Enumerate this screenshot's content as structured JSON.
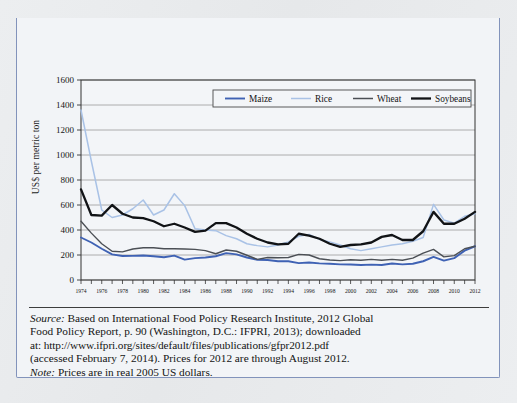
{
  "figure": {
    "number_label": "FIGURE 9.3",
    "title": "World Prices for Agricultural Commodities, 1974–2012"
  },
  "note": {
    "source_label": "Source:",
    "source_line1": " Based on International Food Policy Research Institute, 2012 Global",
    "source_line2": "Food Policy Report, p. 90 (Washington, D.C.: IFPRI, 2013); downloaded",
    "source_line3": "at: http://www.ifpri.org/sites/default/files/publications/gfpr2012.pdf",
    "source_line4": "(accessed February 7, 2014). Prices for 2012 are through August 2012.",
    "note_label": "Note:",
    "note_line": " Prices are in real 2005 US dollars."
  },
  "colors": {
    "header_blue": "#2a4c9b",
    "box_border": "#8293bb",
    "maize": "#3f62b4",
    "rice": "#a9c2e6",
    "wheat": "#4b4f55",
    "soybeans": "#111316",
    "gridline": "#9a9a9a",
    "plot_bg": "#f3f5f8"
  },
  "chart_data": {
    "type": "line",
    "title": "World Prices for Agricultural Commodities, 1974–2012",
    "xlabel": "",
    "ylabel": "US$ per metric ton",
    "ylim": [
      0,
      1600
    ],
    "ytick_step": 200,
    "yticks": [
      0,
      200,
      400,
      600,
      800,
      1000,
      1200,
      1400,
      1600
    ],
    "grid": true,
    "legend_position": "top",
    "xlim": [
      1974,
      2012
    ],
    "x": [
      1974,
      1975,
      1976,
      1977,
      1978,
      1979,
      1980,
      1981,
      1982,
      1983,
      1984,
      1985,
      1986,
      1987,
      1988,
      1989,
      1990,
      1991,
      1992,
      1993,
      1994,
      1995,
      1996,
      1997,
      1998,
      1999,
      2000,
      2001,
      2002,
      2003,
      2004,
      2005,
      2006,
      2007,
      2008,
      2009,
      2010,
      2011,
      2012
    ],
    "xtick_labels": [
      "1974",
      "1976",
      "1978",
      "1980",
      "1982",
      "1984",
      "1986",
      "1988",
      "1990",
      "1992",
      "1994",
      "1996",
      "1998",
      "2000",
      "2002",
      "2004",
      "2006",
      "2008",
      "2010",
      "2012"
    ],
    "series": [
      {
        "name": "Maize",
        "color": "#3f62b4",
        "width": 1.9,
        "values": [
          340,
          300,
          250,
          205,
          192,
          193,
          196,
          190,
          182,
          195,
          163,
          175,
          180,
          190,
          215,
          205,
          180,
          162,
          160,
          150,
          150,
          135,
          140,
          133,
          130,
          125,
          124,
          120,
          123,
          120,
          132,
          125,
          130,
          150,
          185,
          155,
          175,
          235,
          270
        ]
      },
      {
        "name": "Rice",
        "color": "#a9c2e6",
        "width": 1.5,
        "values": [
          1360,
          950,
          560,
          500,
          520,
          570,
          640,
          520,
          560,
          690,
          595,
          410,
          400,
          395,
          355,
          330,
          290,
          275,
          265,
          280,
          305,
          350,
          365,
          325,
          305,
          280,
          250,
          235,
          250,
          265,
          280,
          290,
          310,
          340,
          605,
          480,
          455,
          510,
          530
        ]
      },
      {
        "name": "Wheat",
        "color": "#4b4f55",
        "width": 1.4,
        "values": [
          470,
          375,
          290,
          230,
          225,
          248,
          258,
          258,
          250,
          250,
          248,
          245,
          235,
          210,
          240,
          230,
          198,
          165,
          180,
          178,
          180,
          205,
          200,
          170,
          160,
          155,
          162,
          158,
          165,
          158,
          165,
          158,
          175,
          215,
          245,
          185,
          195,
          250,
          270
        ]
      },
      {
        "name": "Soybeans",
        "color": "#111316",
        "width": 2.3,
        "values": [
          725,
          520,
          515,
          600,
          530,
          500,
          495,
          470,
          430,
          450,
          420,
          385,
          395,
          455,
          455,
          420,
          370,
          330,
          300,
          285,
          290,
          370,
          355,
          330,
          290,
          265,
          280,
          285,
          300,
          345,
          360,
          320,
          320,
          390,
          545,
          450,
          450,
          490,
          545
        ]
      }
    ]
  }
}
